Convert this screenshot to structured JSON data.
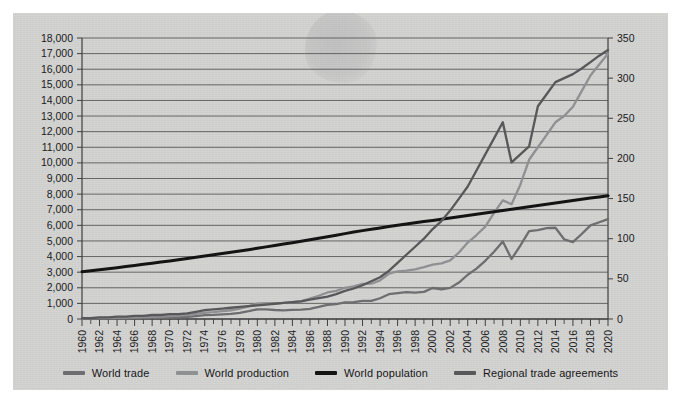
{
  "figure": {
    "background_color": "#d3d3d2",
    "plot_area": {
      "left": 69,
      "right": 595,
      "top": 25,
      "bottom": 306
    }
  },
  "legend": {
    "position": "bottom-center",
    "items": [
      {
        "label": "World trade",
        "color": "#6e6e70",
        "icon": "line-swatch"
      },
      {
        "label": "World production",
        "color": "#8f9092",
        "icon": "line-swatch"
      },
      {
        "label": "World population",
        "color": "#141414",
        "icon": "line-swatch"
      },
      {
        "label": "Regional trade agreements",
        "color": "#58585a",
        "icon": "line-swatch"
      }
    ]
  },
  "chart_data": {
    "type": "line",
    "title": "",
    "subtitle": "",
    "xlabel": "",
    "ylabel": "",
    "grid": true,
    "legend_position": "bottom",
    "x": [
      1960,
      1961,
      1962,
      1963,
      1964,
      1965,
      1966,
      1967,
      1968,
      1969,
      1970,
      1971,
      1972,
      1973,
      1974,
      1975,
      1976,
      1977,
      1978,
      1979,
      1980,
      1981,
      1982,
      1983,
      1984,
      1985,
      1986,
      1987,
      1988,
      1989,
      1990,
      1991,
      1992,
      1993,
      1994,
      1995,
      1996,
      1997,
      1998,
      1999,
      2000,
      2001,
      2002,
      2003,
      2004,
      2005,
      2006,
      2007,
      2008,
      2009,
      2010,
      2011,
      2012,
      2013,
      2014,
      2015,
      2016,
      2017,
      2018,
      2019,
      2020
    ],
    "x_tick_labels": [
      "1960",
      "1962",
      "1964",
      "1966",
      "1968",
      "1970",
      "1972",
      "1974",
      "1976",
      "1978",
      "1980",
      "1982",
      "1984",
      "1986",
      "1988",
      "1990",
      "1992",
      "1994",
      "1996",
      "1998",
      "2000",
      "2002",
      "2004",
      "2006",
      "2008",
      "2010",
      "2012",
      "2014",
      "2016",
      "2018",
      "2020"
    ],
    "x_tick_interval_years": 2,
    "x_minor_tick_interval_years": 1,
    "xlim": [
      1960,
      2020
    ],
    "axes": [
      {
        "id": "left",
        "side": "left",
        "ylim": [
          0,
          18000
        ],
        "tick_step": 1000,
        "tick_labels": [
          "0",
          "1,000",
          "2,000",
          "3,000",
          "4,000",
          "5,000",
          "6,000",
          "7,000",
          "8,000",
          "9,000",
          "10,000",
          "11,000",
          "12,000",
          "13,000",
          "14,000",
          "15,000",
          "16,000",
          "17,000",
          "18,000"
        ],
        "units": "US$ billions / millions of people"
      },
      {
        "id": "right",
        "side": "right",
        "ylim": [
          0,
          350
        ],
        "tick_step": 50,
        "tick_labels": [
          "0",
          "50",
          "100",
          "150",
          "200",
          "250",
          "300",
          "350"
        ],
        "units": "count of agreements"
      }
    ],
    "series": [
      {
        "name": "World trade",
        "axis": "left",
        "color": "#6e6e70",
        "width": 2.3,
        "values": [
          130,
          140,
          150,
          165,
          185,
          205,
          225,
          240,
          265,
          300,
          340,
          380,
          450,
          620,
          830,
          870,
          990,
          1090,
          1300,
          1640,
          2030,
          2010,
          1880,
          1810,
          1910,
          1950,
          2130,
          2510,
          2930,
          3120,
          3450,
          3500,
          3750,
          3780,
          4320,
          5170,
          5400,
          5590,
          5490,
          5650,
          6450,
          6200,
          6490,
          7590,
          9220,
          10490,
          12130,
          14020,
          16160,
          12500,
          15300,
          18300,
          18500,
          18900,
          19000,
          16600,
          16000,
          17700,
          19500,
          18900,
          17600
        ],
        "values_display_scale": "thousands of US$ billions plotted on left axis (chart reads ~0 to ~6,400 at scale shown)",
        "plot_values": [
          20,
          24,
          28,
          33,
          38,
          45,
          52,
          58,
          66,
          78,
          90,
          105,
          130,
          185,
          250,
          265,
          300,
          330,
          395,
          500,
          620,
          615,
          575,
          555,
          585,
          600,
          655,
          770,
          900,
          960,
          1060,
          1075,
          1155,
          1165,
          1330,
          1590,
          1660,
          1720,
          1690,
          1740,
          1985,
          1905,
          1995,
          2335,
          2835,
          3225,
          3730,
          4310,
          4970,
          3845,
          4705,
          5625,
          5690,
          5815,
          5845,
          5105,
          4920,
          5445,
          6000,
          6200,
          6400
        ]
      },
      {
        "name": "World production",
        "axis": "left",
        "color": "#8f9092",
        "width": 2.3,
        "plot_values": [
          55,
          60,
          68,
          76,
          85,
          95,
          108,
          120,
          135,
          155,
          180,
          210,
          255,
          330,
          400,
          440,
          500,
          560,
          660,
          810,
          990,
          1010,
          1010,
          1030,
          1080,
          1140,
          1310,
          1490,
          1700,
          1800,
          2000,
          2090,
          2250,
          2260,
          2470,
          2900,
          3050,
          3100,
          3180,
          3320,
          3480,
          3560,
          3760,
          4260,
          4900,
          5380,
          5920,
          6800,
          7600,
          7350,
          8600,
          10200,
          11000,
          11800,
          12600,
          13000,
          13600,
          14600,
          15600,
          16300,
          17000
        ]
      },
      {
        "name": "World population",
        "axis": "left",
        "color": "#141414",
        "width": 3.0,
        "plot_values": [
          3030,
          3090,
          3150,
          3220,
          3290,
          3360,
          3430,
          3500,
          3570,
          3650,
          3720,
          3800,
          3880,
          3960,
          4040,
          4120,
          4200,
          4280,
          4360,
          4440,
          4530,
          4620,
          4710,
          4800,
          4890,
          4980,
          5080,
          5170,
          5270,
          5370,
          5470,
          5570,
          5660,
          5750,
          5830,
          5920,
          6000,
          6080,
          6160,
          6240,
          6310,
          6390,
          6470,
          6550,
          6630,
          6710,
          6790,
          6870,
          6950,
          7030,
          7110,
          7190,
          7270,
          7350,
          7430,
          7510,
          7590,
          7670,
          7750,
          7820,
          7900
        ]
      },
      {
        "name": "Regional trade agreements",
        "axis": "right",
        "color": "#58585a",
        "width": 2.3,
        "plot_values": [
          1,
          1,
          2,
          2,
          3,
          3,
          4,
          4,
          5,
          5,
          6,
          6,
          7,
          9,
          11,
          12,
          13,
          14,
          15,
          16,
          17,
          18,
          19,
          20,
          21,
          22,
          24,
          26,
          28,
          31,
          35,
          38,
          42,
          47,
          52,
          60,
          70,
          80,
          90,
          100,
          112,
          122,
          135,
          150,
          165,
          185,
          205,
          225,
          245,
          195,
          205,
          215,
          265,
          280,
          295,
          300,
          305,
          312,
          320,
          328,
          335
        ]
      }
    ],
    "annotations": [
      {
        "kind": "note",
        "text": "Regional trade agreements spike to ~245 in 2008 then drop to ~195 in 2009 before resuming growth"
      },
      {
        "kind": "note",
        "text": "World trade dips sharply in 2009 and again around 2015-2016"
      }
    ]
  }
}
